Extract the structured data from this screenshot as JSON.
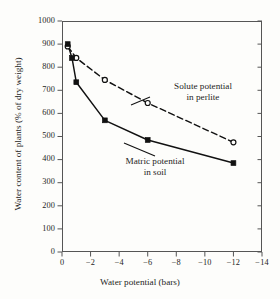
{
  "chart_data": {
    "type": "line",
    "title": "",
    "xlabel": "Water potential (bars)",
    "ylabel": "Water content of plants (% of dry weight)",
    "xlim": [
      0,
      -14
    ],
    "ylim": [
      0,
      1000
    ],
    "grid": false,
    "legend_position": "inline-annotations",
    "xticks": [
      "0",
      "−2",
      "−4",
      "−6",
      "−8",
      "−10",
      "−12",
      "−14"
    ],
    "xtick_values": [
      0,
      -2,
      -4,
      -6,
      -8,
      -10,
      -12,
      -14
    ],
    "yticks": [
      "0",
      "100",
      "200",
      "300",
      "400",
      "500",
      "600",
      "700",
      "800",
      "900",
      "1000"
    ],
    "ytick_values": [
      0,
      100,
      200,
      300,
      400,
      500,
      600,
      700,
      800,
      900,
      1000
    ],
    "series": [
      {
        "name": "Solute potential in perlite",
        "marker": "open-circle",
        "line_style": "dashed",
        "color": "#111111",
        "x": [
          -0.4,
          -1.0,
          -3.0,
          -6.0,
          -12.0
        ],
        "values": [
          890,
          840,
          745,
          645,
          475
        ]
      },
      {
        "name": "Matric potential in soil",
        "marker": "filled-square",
        "line_style": "solid",
        "color": "#111111",
        "x": [
          -0.4,
          -0.7,
          -1.0,
          -3.0,
          -6.0,
          -12.0
        ],
        "values": [
          900,
          840,
          735,
          570,
          485,
          385
        ]
      }
    ],
    "annotations": [
      {
        "name": "solute-label",
        "line1": "Solute potential",
        "line2": "in perlite"
      },
      {
        "name": "matric-label",
        "line1": "Matric potential",
        "line2": "in soil"
      }
    ]
  },
  "axes": {
    "x_title": "Water potential (bars)",
    "y_title": "Water content of plants (% of dry weight)"
  },
  "annotations": {
    "solute": {
      "line1": "Solute potential",
      "line2": "in perlite"
    },
    "matric": {
      "line1": "Matric potential",
      "line2": "in soil"
    }
  },
  "colors": {
    "ink": "#111111",
    "axis": "#555555",
    "background": "#fdfdfb"
  }
}
